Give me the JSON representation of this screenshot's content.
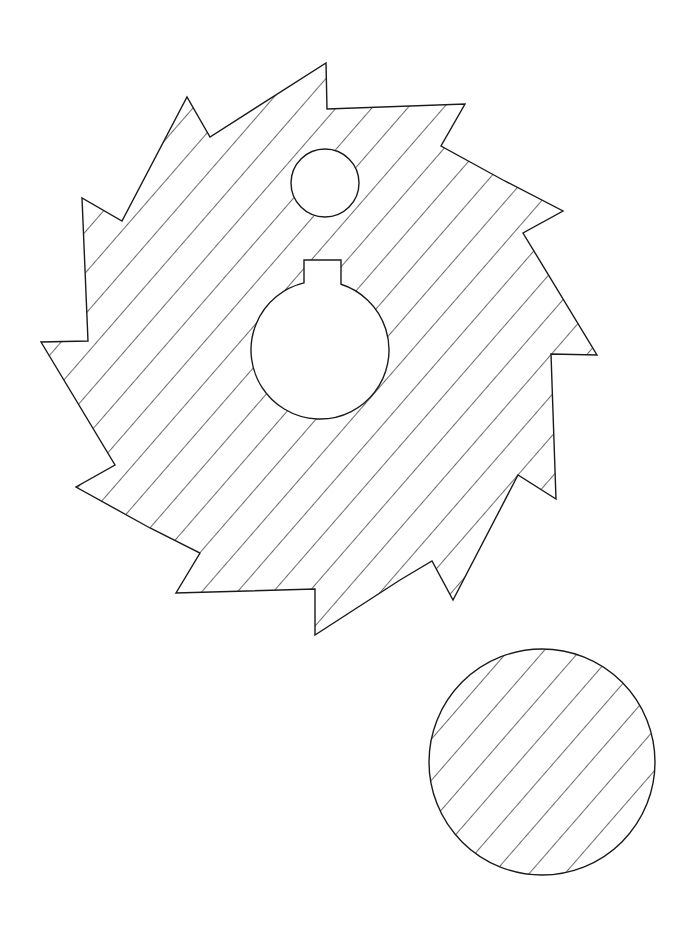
{
  "drawing": {
    "width": 691,
    "height": 927,
    "background": "#ffffff",
    "stroke": "#1a1a1a",
    "hatch_angle_deg": 41,
    "hatch_spacing": 27,
    "blade": {
      "points": [
        [
          326,
          63
        ],
        [
          327,
          109
        ],
        [
          465,
          104
        ],
        [
          441,
          146
        ],
        [
          503,
          180
        ],
        [
          563,
          211
        ],
        [
          523,
          233
        ],
        [
          597,
          355
        ],
        [
          551,
          354
        ],
        [
          556,
          499
        ],
        [
          518,
          475
        ],
        [
          453,
          600
        ],
        [
          432,
          561
        ],
        [
          400,
          580
        ],
        [
          315,
          635
        ],
        [
          315,
          589
        ],
        [
          176,
          593
        ],
        [
          200,
          553
        ],
        [
          150,
          528
        ],
        [
          76,
          487
        ],
        [
          115,
          465
        ],
        [
          41,
          342
        ],
        [
          88,
          341
        ],
        [
          82,
          198
        ],
        [
          122,
          221
        ],
        [
          187,
          97
        ],
        [
          210,
          137
        ]
      ]
    },
    "small_hole": {
      "cx": 325,
      "cy": 183,
      "r": 34
    },
    "arbor_hole": {
      "cx": 320,
      "cy": 350,
      "r": 69,
      "key": {
        "x1": 304,
        "x2": 341,
        "top": 260
      }
    },
    "disc": {
      "cx": 542,
      "cy": 762,
      "r": 113
    }
  }
}
